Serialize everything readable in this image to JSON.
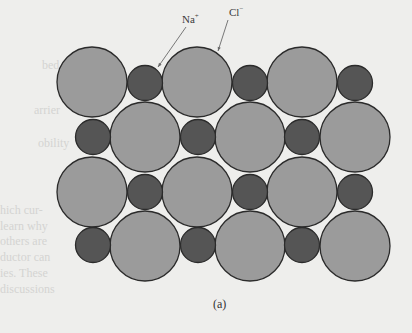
{
  "figure": {
    "caption": "(a)",
    "labels": {
      "sodium": {
        "base": "Na",
        "charge": "+"
      },
      "chloride": {
        "base": "Cl",
        "charge": "−"
      }
    },
    "colors": {
      "background": "#eeeeec",
      "large_ion_fill": "#9b9b9b",
      "small_ion_fill": "#555555",
      "outline": "#2b2b2b",
      "leader_line": "#6a6a6a"
    },
    "ions": {
      "large_radius": 35,
      "small_radius": 17.5,
      "large": [
        {
          "cx": 92,
          "cy": 82
        },
        {
          "cx": 197,
          "cy": 82
        },
        {
          "cx": 302,
          "cy": 82
        },
        {
          "cx": 145,
          "cy": 137
        },
        {
          "cx": 250,
          "cy": 137
        },
        {
          "cx": 355,
          "cy": 137
        },
        {
          "cx": 92,
          "cy": 192
        },
        {
          "cx": 197,
          "cy": 192
        },
        {
          "cx": 302,
          "cy": 192
        },
        {
          "cx": 145,
          "cy": 246
        },
        {
          "cx": 250,
          "cy": 246
        },
        {
          "cx": 355,
          "cy": 246
        }
      ],
      "small": [
        {
          "cx": 145,
          "cy": 83
        },
        {
          "cx": 250,
          "cy": 83
        },
        {
          "cx": 355,
          "cy": 83
        },
        {
          "cx": 93,
          "cy": 137
        },
        {
          "cx": 198,
          "cy": 137
        },
        {
          "cx": 302,
          "cy": 137
        },
        {
          "cx": 145,
          "cy": 192
        },
        {
          "cx": 250,
          "cy": 192
        },
        {
          "cx": 355,
          "cy": 192
        },
        {
          "cx": 93,
          "cy": 245
        },
        {
          "cx": 198,
          "cy": 245
        },
        {
          "cx": 302,
          "cy": 245
        }
      ]
    },
    "leaders": [
      {
        "name": "sodium",
        "x1": 186,
        "y1": 27,
        "x2": 158,
        "y2": 67
      },
      {
        "name": "chloride",
        "x1": 228,
        "y1": 20,
        "x2": 218,
        "y2": 51
      }
    ]
  },
  "bleed_through_text": {
    "left": [
      "bed",
      "arrier",
      "obility",
      "hich cur-",
      "learn why",
      "others are",
      "ductor can",
      "ies. These",
      "discussions"
    ]
  }
}
